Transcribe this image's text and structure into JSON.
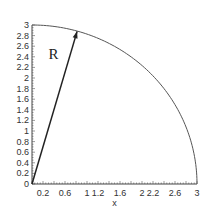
{
  "chart_data": {
    "type": "line",
    "title": "",
    "xlabel": "x",
    "ylabel": "",
    "xlim": [
      0,
      3
    ],
    "ylim": [
      0,
      3
    ],
    "grid": false,
    "x_tick_labels": [
      "0.2",
      "0.6",
      "1",
      "1.2",
      "1.6",
      "2",
      "2.2",
      "2.6",
      "3"
    ],
    "x_tick_values": [
      0.2,
      0.6,
      1.0,
      1.2,
      1.6,
      2.0,
      2.2,
      2.6,
      3.0
    ],
    "y_tick_labels": [
      "0",
      "0.2",
      "0.4",
      "0.6",
      "0.8",
      "1",
      "1.2",
      "1.4",
      "1.6",
      "1.8",
      "2",
      "2.2",
      "2.4",
      "2.6",
      "2.8",
      "3"
    ],
    "y_tick_values": [
      0,
      0.2,
      0.4,
      0.6,
      0.8,
      1.0,
      1.2,
      1.4,
      1.6,
      1.8,
      2.0,
      2.2,
      2.4,
      2.6,
      2.8,
      3.0
    ],
    "series": [
      {
        "name": "quarter circle",
        "description": "x^2 + y^2 = 9, first quadrant",
        "radius": 3,
        "color": "#555555"
      },
      {
        "name": "radius arrow",
        "from": [
          0,
          0
        ],
        "to": [
          0.82,
          2.88
        ],
        "color": "#222222"
      }
    ],
    "annotations": [
      {
        "text": "R",
        "x": 0.3,
        "y": 2.35
      }
    ]
  }
}
